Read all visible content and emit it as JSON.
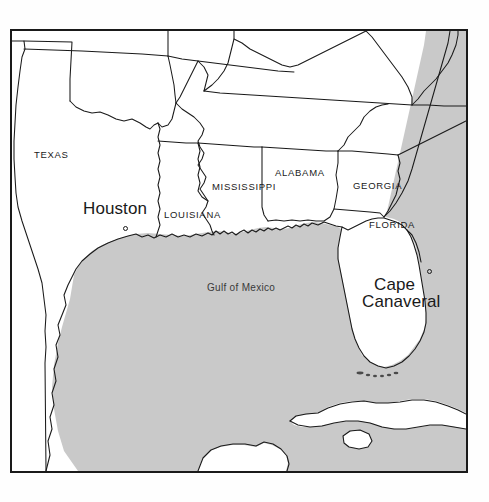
{
  "map": {
    "title": "Gulf of Mexico Region Map",
    "colors": {
      "water": "#c9c9c9",
      "land": "#ffffff",
      "border": "#1a1a1a",
      "text": "#1a1a1a",
      "page_background": "#fefefe"
    },
    "state_labels": [
      {
        "name": "TEXAS",
        "text": "TEXAS",
        "x": 22,
        "y": 124
      },
      {
        "name": "LOUISIANA",
        "text": "LOUISIANA",
        "x": 152,
        "y": 184
      },
      {
        "name": "MISSISSIPPI",
        "text": "MISSISSIPPI",
        "x": 200,
        "y": 155
      },
      {
        "name": "ALABAMA",
        "text": "ALABAMA",
        "x": 263,
        "y": 142
      },
      {
        "name": "GEORGIA",
        "text": "GEORGIA",
        "x": 341,
        "y": 155
      },
      {
        "name": "FLORIDA",
        "text": "FLORIDA",
        "x": 357,
        "y": 194
      }
    ],
    "city_labels": [
      {
        "name": "Houston",
        "line1": "Houston",
        "line2": "",
        "x": 71,
        "y": 178,
        "dot_x": 111,
        "dot_y": 198
      },
      {
        "name": "Cape Canaveral",
        "line1": "Cape",
        "line2": "Canaveral",
        "x": 362,
        "y": 252,
        "dot_x": 415,
        "dot_y": 245
      }
    ],
    "water_labels": [
      {
        "name": "Gulf of Mexico",
        "text": "Gulf of Mexico",
        "x": 195,
        "y": 258
      }
    ]
  }
}
